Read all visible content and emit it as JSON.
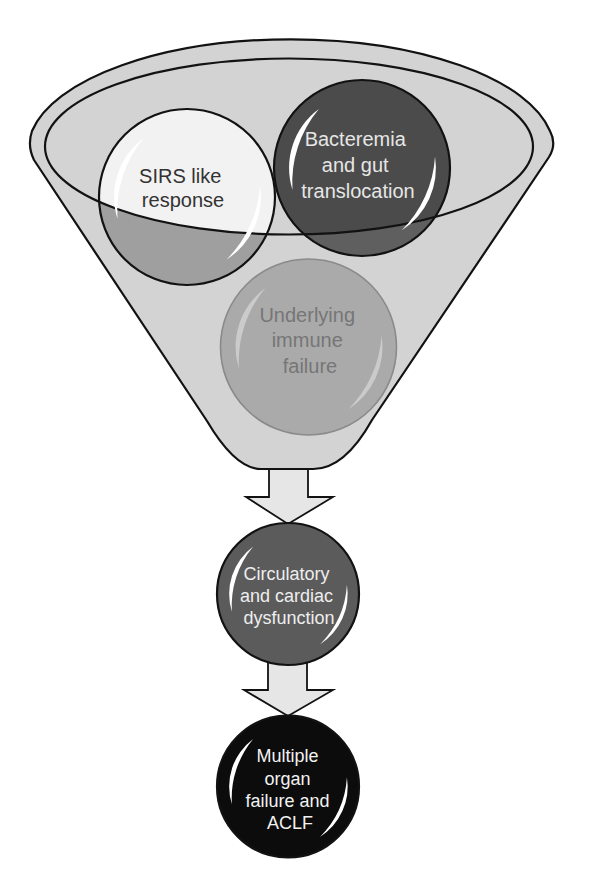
{
  "diagram": {
    "funnel": {
      "fill": "#d3d3d3",
      "stroke": "#121212",
      "rim_label": "funnel-rim"
    },
    "funnel_inputs": [
      {
        "id": "sirs",
        "lines": [
          "SIRS like",
          "response"
        ],
        "fill_inner": "#f2f2f2",
        "fill_outer": "#9f9f9f",
        "text_color": "#333333"
      },
      {
        "id": "bacteremia",
        "lines": [
          "Bacteremia",
          "and gut",
          "translocation"
        ],
        "fill_inner": "#4b4b4b",
        "fill_outer": "#5f5f5f",
        "text_color": "#e6e6e6"
      },
      {
        "id": "immune-failure",
        "lines": [
          "Underlying",
          "immune",
          "failure"
        ],
        "fill": "#aaaaaa",
        "stroke": "#8a8a8a",
        "text_color": "#767676"
      }
    ],
    "flow": [
      {
        "id": "circulatory",
        "lines": [
          "Circulatory",
          "and cardiac",
          "dysfunction"
        ],
        "fill": "#5b5b5b",
        "text_color": "#eeeeee"
      },
      {
        "id": "organ-failure",
        "lines": [
          "Multiple",
          "organ",
          "failure and",
          "ACLF"
        ],
        "fill": "#0c0c0c",
        "text_color": "#f2f2f2"
      }
    ],
    "arrows": {
      "fill": "#e6e6e6",
      "stroke": "#121212"
    },
    "highlight_color": "#ffffff"
  }
}
